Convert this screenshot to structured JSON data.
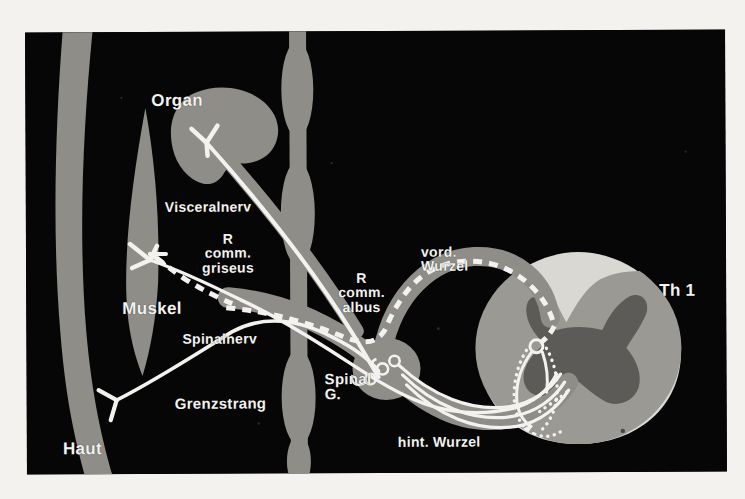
{
  "figure": {
    "type": "anatomical-diagram",
    "language": "de",
    "background_color": "#060607",
    "paper_color": "#f4f2ee",
    "ink_color": "#f3f2ef",
    "tissue_gray": "#8e8d88",
    "cord_light": "#d9d8d2",
    "cord_mid": "#9a9993",
    "cord_dark": "#5c5b57"
  },
  "labels": [
    {
      "id": "organ",
      "text": "Organ",
      "x": 126,
      "y": 68,
      "size": 15,
      "align": "left"
    },
    {
      "id": "visceralnerv",
      "text": "Visceralnerv",
      "x": 166,
      "y": 175,
      "size": 13,
      "align": "left"
    },
    {
      "id": "r-comm-griseus",
      "text": "R\ncomm.\ngriseus",
      "x": 193,
      "y": 212,
      "size": 13,
      "align": "left"
    },
    {
      "id": "muskel",
      "text": "Muskel",
      "x": 118,
      "y": 276,
      "size": 15,
      "align": "left"
    },
    {
      "id": "spinalnerv",
      "text": "Spinalnerv",
      "x": 180,
      "y": 307,
      "size": 13,
      "align": "left"
    },
    {
      "id": "r-comm-albus",
      "text": "R\ncomm.\nalbus",
      "x": 336,
      "y": 248,
      "size": 13,
      "align": "left"
    },
    {
      "id": "vord-wurzel",
      "text": "vord.\nWurzel",
      "x": 419,
      "y": 222,
      "size": 13,
      "align": "left"
    },
    {
      "id": "th1",
      "text": "Th 1",
      "x": 657,
      "y": 260,
      "size": 16,
      "align": "left"
    },
    {
      "id": "spinal-g",
      "text": "Spinal\nG.",
      "x": 324,
      "y": 348,
      "size": 13,
      "align": "left"
    },
    {
      "id": "grenzstrang",
      "text": "Grenzstrang",
      "x": 172,
      "y": 371,
      "size": 14,
      "align": "left"
    },
    {
      "id": "hint-wurzel",
      "text": "hint. Wurzel",
      "x": 395,
      "y": 411,
      "size": 13,
      "align": "left"
    },
    {
      "id": "haut",
      "text": "Haut",
      "x": 60,
      "y": 416,
      "size": 15,
      "align": "left"
    }
  ],
  "structures": [
    {
      "id": "haut-band",
      "name": "skin-band",
      "description": "curved gray band, far left, full height"
    },
    {
      "id": "muskel-body",
      "name": "muscle-spindle",
      "description": "leaf shaped gray muscle belly, left"
    },
    {
      "id": "organ-body",
      "name": "visceral-organ",
      "description": "kidney shaped gray organ, upper left"
    },
    {
      "id": "grenzstrang",
      "name": "sympathetic-trunk",
      "description": "vertical beaded ganglion chain, center"
    },
    {
      "id": "spinal-gang",
      "name": "spinal-ganglion",
      "description": "oval ganglion on dorsal root"
    },
    {
      "id": "cord",
      "name": "spinal-cord-section",
      "description": "cross section of thoracic cord Th 1, right"
    }
  ],
  "fibers": [
    {
      "id": "visceral-efferent",
      "name": "visceral-nerve-fiber",
      "style": "solid",
      "description": "organ to sympathetic trunk"
    },
    {
      "id": "r-comm-griseus-fib",
      "name": "ramus-communicans-griseus",
      "style": "dashed",
      "description": "postganglionic gray ramus to muscle/skin"
    },
    {
      "id": "r-comm-albus-fib",
      "name": "ramus-communicans-albus",
      "style": "dashed",
      "description": "preganglionic white ramus from ventral root"
    },
    {
      "id": "motor-fiber",
      "name": "motor-fiber",
      "style": "solid",
      "description": "ventral root motor axon to muscle endplate"
    },
    {
      "id": "sensory-fiber",
      "name": "sensory-fiber",
      "style": "solid",
      "description": "skin receptor to spinal ganglion to dorsal root"
    },
    {
      "id": "cord-interneuron",
      "name": "interneuron-fiber",
      "style": "dotted",
      "description": "dotted tracts inside gray matter"
    }
  ],
  "endings": [
    {
      "id": "organ-ending",
      "name": "visceral-effector-ending",
      "x": 180,
      "y": 111
    },
    {
      "id": "muscle-ending",
      "name": "motor-endplate",
      "x": 119,
      "y": 224
    },
    {
      "id": "skin-ending",
      "name": "sensory-receptor",
      "x": 86,
      "y": 366
    }
  ]
}
